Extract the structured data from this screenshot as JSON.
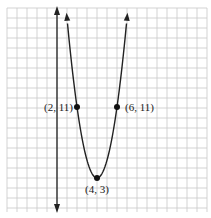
{
  "chart_data": {
    "type": "line",
    "title": "",
    "xlabel": "",
    "ylabel": "",
    "function": "y = 2(x - 4)^2 + 3",
    "grid": true,
    "legend": null,
    "xlim": [
      -5.2,
      14.8
    ],
    "ylim": [
      -0.8,
      22.2
    ],
    "points": [
      {
        "x": 2,
        "y": 11,
        "label": "(2, 11)"
      },
      {
        "x": 4,
        "y": 3,
        "label": "(4, 3)"
      },
      {
        "x": 6,
        "y": 11,
        "label": "(6, 11)"
      }
    ],
    "series": [
      {
        "name": "parabola",
        "x": [
          0.85,
          2,
          3,
          4,
          5,
          6,
          7.15
        ],
        "y": [
          22.8,
          11,
          5,
          3,
          5,
          11,
          22.8
        ]
      }
    ]
  },
  "labels": {
    "p1": "(2, 11)",
    "p2": "(6, 11)",
    "vertex": "(4, 3)"
  },
  "colors": {
    "grid": "#c8c8c8",
    "curve": "#222222",
    "axis": "#222222"
  }
}
